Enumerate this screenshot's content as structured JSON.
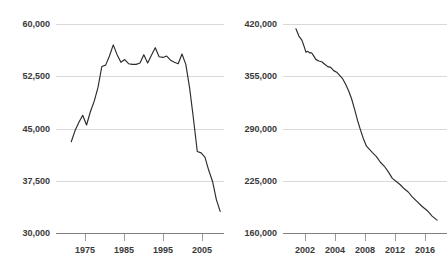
{
  "figure": {
    "background_color": "#ffffff",
    "line_color": "#2b2b2b",
    "grid_color": "#d9d9d9",
    "axis_color": "#808080",
    "label_color": "#3a3a3a",
    "panel_count": 2
  },
  "chart_data": [
    {
      "type": "line",
      "panel": "left",
      "title": "",
      "subtitle": "",
      "xlabel": "",
      "ylabel": "",
      "grid": true,
      "grid_axis": "y",
      "legend": "none",
      "xlim": [
        1973,
        2017
      ],
      "ylim": [
        30000,
        60000
      ],
      "yticks": [
        30000,
        37500,
        45000,
        52500,
        60000
      ],
      "ytick_labels": [
        "30,000",
        "37,500",
        "45,000",
        "52,500",
        "60,000"
      ],
      "xticks": [
        1975,
        1985,
        1995,
        2005,
        2015
      ],
      "xtick_labels": [
        "1975",
        "1985",
        "1995",
        "2005",
        "2015"
      ],
      "x": [
        1977,
        1978,
        1979,
        1980,
        1981,
        1982,
        1983,
        1984,
        1985,
        1986,
        1987,
        1988,
        1989,
        1990,
        1991,
        1992,
        1993,
        1994,
        1995,
        1996,
        1997,
        1998,
        1999,
        2000,
        2001,
        2002,
        2003,
        2004,
        2005,
        2006,
        2007,
        2008,
        2009,
        2010,
        2011,
        2012,
        2013,
        2014,
        2015,
        2016
      ],
      "values": [
        43100,
        44700,
        45900,
        46900,
        45500,
        47400,
        48900,
        50900,
        53900,
        54100,
        55400,
        57000,
        55600,
        54500,
        54900,
        54300,
        54200,
        54200,
        54400,
        55600,
        54400,
        55500,
        56600,
        55300,
        55200,
        55400,
        54800,
        54500,
        54300,
        55700,
        54200,
        50800,
        46400,
        41700,
        41500,
        40900,
        39000,
        37400,
        34800,
        33100
      ]
    },
    {
      "type": "line",
      "panel": "right",
      "title": "",
      "subtitle": "",
      "xlabel": "",
      "ylabel": "",
      "grid": true,
      "grid_axis": "y",
      "legend": "none",
      "xlim": [
        2001,
        2017.5
      ],
      "ylim": [
        160000,
        420000
      ],
      "yticks": [
        160000,
        225000,
        290000,
        355000,
        420000
      ],
      "ytick_labels": [
        "160,000",
        "225,000",
        "290,000",
        "355,000",
        "420,000"
      ],
      "xticks": [
        2002,
        2004,
        2008,
        2012,
        2016
      ],
      "xtick_labels": [
        "2002",
        "2004",
        "2008",
        "2012",
        "2016"
      ],
      "x": [
        2002.3,
        2002.6,
        2002.9,
        2003.1,
        2003.3,
        2003.5,
        2003.7,
        2003.9,
        2004.1,
        2004.3,
        2004.6,
        2004.9,
        2005.2,
        2005.5,
        2005.8,
        2006.1,
        2006.4,
        2006.7,
        2007.0,
        2007.3,
        2007.6,
        2007.9,
        2008.2,
        2008.5,
        2008.8,
        2009.1,
        2009.4,
        2009.7,
        2010.0,
        2010.4,
        2010.8,
        2011.2,
        2011.6,
        2012.0,
        2012.4,
        2012.8,
        2013.2,
        2013.6,
        2014.0,
        2014.5,
        2015.0,
        2015.5,
        2016.0,
        2016.5
      ],
      "values": [
        414000,
        405000,
        400000,
        393000,
        385000,
        386000,
        384000,
        384000,
        380000,
        376000,
        374000,
        373000,
        370000,
        367000,
        366000,
        362000,
        360000,
        356000,
        352000,
        345000,
        337000,
        327000,
        314000,
        300000,
        288000,
        277000,
        268000,
        264000,
        260000,
        255000,
        248000,
        243000,
        236000,
        228000,
        224000,
        220000,
        215000,
        211000,
        205000,
        199000,
        193000,
        188000,
        181000,
        176000
      ]
    }
  ]
}
